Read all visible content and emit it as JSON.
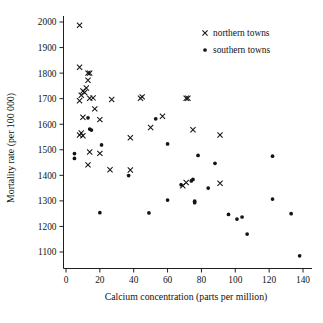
{
  "chart_data": {
    "type": "scatter",
    "title": "",
    "xlabel": "Calcium concentration (parts per million)",
    "ylabel": "Mortality rate (per 100 000)",
    "xlim": [
      0,
      140
    ],
    "ylim": [
      1050,
      2030
    ],
    "xticks": [
      0,
      20,
      40,
      60,
      80,
      100,
      120,
      140
    ],
    "yticks": [
      1100,
      1200,
      1300,
      1400,
      1500,
      1600,
      1700,
      1800,
      1900,
      2000
    ],
    "grid": false,
    "legend_position": "top-right",
    "legend": [
      {
        "label": "northern towns",
        "marker": "cross"
      },
      {
        "label": "southern towns",
        "marker": "dot"
      }
    ],
    "series": [
      {
        "name": "northern towns",
        "marker": "cross",
        "points": [
          [
            8,
            1987
          ],
          [
            8,
            1823
          ],
          [
            13,
            1800
          ],
          [
            14,
            1800
          ],
          [
            13,
            1772
          ],
          [
            12,
            1742
          ],
          [
            10,
            1730
          ],
          [
            11,
            1724
          ],
          [
            9,
            1713
          ],
          [
            8,
            1692
          ],
          [
            16,
            1703
          ],
          [
            14,
            1702
          ],
          [
            27,
            1697
          ],
          [
            44,
            1702
          ],
          [
            45,
            1707
          ],
          [
            71,
            1702
          ],
          [
            72,
            1702
          ],
          [
            17,
            1660
          ],
          [
            10,
            1627
          ],
          [
            20,
            1618
          ],
          [
            57,
            1631
          ],
          [
            50,
            1587
          ],
          [
            75,
            1578
          ],
          [
            91,
            1558
          ],
          [
            38,
            1547
          ],
          [
            9,
            1566
          ],
          [
            8,
            1558
          ],
          [
            10,
            1555
          ],
          [
            14,
            1491
          ],
          [
            20,
            1486
          ],
          [
            13,
            1441
          ],
          [
            26,
            1422
          ],
          [
            38,
            1421
          ],
          [
            69,
            1359
          ],
          [
            71,
            1372
          ],
          [
            91,
            1369
          ]
        ]
      },
      {
        "name": "southern towns",
        "marker": "dot",
        "points": [
          [
            5,
            1485
          ],
          [
            5,
            1466
          ],
          [
            13,
            1625
          ],
          [
            14,
            1581
          ],
          [
            15,
            1577
          ],
          [
            21,
            1519
          ],
          [
            60,
            1523
          ],
          [
            53,
            1621
          ],
          [
            78,
            1478
          ],
          [
            88,
            1447
          ],
          [
            122,
            1475
          ],
          [
            37,
            1399
          ],
          [
            68,
            1363
          ],
          [
            74,
            1378
          ],
          [
            75,
            1384
          ],
          [
            84,
            1350
          ],
          [
            76,
            1299
          ],
          [
            76,
            1293
          ],
          [
            60,
            1303
          ],
          [
            122,
            1307
          ],
          [
            20,
            1254
          ],
          [
            49,
            1253
          ],
          [
            96,
            1247
          ],
          [
            101,
            1229
          ],
          [
            104,
            1237
          ],
          [
            133,
            1250
          ],
          [
            107,
            1170
          ],
          [
            138,
            1085
          ]
        ]
      }
    ]
  }
}
